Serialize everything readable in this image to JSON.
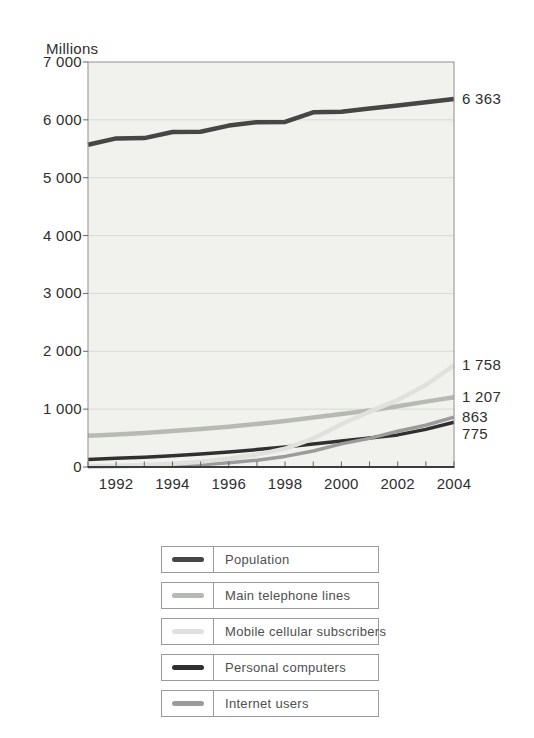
{
  "figure": {
    "unit_label": "Millions"
  },
  "chart_data": {
    "type": "line",
    "title": "",
    "xlabel": "",
    "ylabel": "Millions",
    "xlim": [
      1991,
      2004
    ],
    "ylim": [
      0,
      7000
    ],
    "grid": "horizontal",
    "legend_position": "bottom",
    "x": [
      1991,
      1992,
      1993,
      1994,
      1995,
      1996,
      1997,
      1998,
      1999,
      2000,
      2001,
      2002,
      2003,
      2004
    ],
    "y_ticks": [
      {
        "label": "7 000",
        "value": 7000
      },
      {
        "label": "6 000",
        "value": 6000
      },
      {
        "label": "5 000",
        "value": 5000
      },
      {
        "label": "4 000",
        "value": 4000
      },
      {
        "label": "3 000",
        "value": 3000
      },
      {
        "label": "2 000",
        "value": 2000
      },
      {
        "label": "1 000",
        "value": 1000
      },
      {
        "label": "0",
        "value": 0
      }
    ],
    "x_ticks": [
      {
        "label": "1992",
        "value": 1992
      },
      {
        "label": "1994",
        "value": 1994
      },
      {
        "label": "1996",
        "value": 1996
      },
      {
        "label": "1998",
        "value": 1998
      },
      {
        "label": "2000",
        "value": 2000
      },
      {
        "label": "2002",
        "value": 2002
      },
      {
        "label": "2004",
        "value": 2004
      }
    ],
    "series": [
      {
        "name": "Population",
        "color": "#464646",
        "line_width": 4.5,
        "end_label": "6 363",
        "values": [
          5570,
          5680,
          5685,
          5790,
          5795,
          5900,
          5960,
          5965,
          6130,
          6140,
          6195,
          6250,
          6305,
          6363
        ]
      },
      {
        "name": "Main telephone lines",
        "color": "#b7bab2",
        "line_width": 4.5,
        "end_label": "1 207",
        "values": [
          540,
          560,
          590,
          620,
          655,
          695,
          745,
          795,
          855,
          915,
          975,
          1050,
          1130,
          1207
        ]
      },
      {
        "name": "Mobile cellular subscribers",
        "color": "#e0e1dc",
        "line_width": 4.5,
        "end_label": "1 758",
        "values": [
          16,
          23,
          34,
          56,
          91,
          145,
          215,
          318,
          490,
          740,
          955,
          1157,
          1417,
          1758
        ]
      },
      {
        "name": "Personal computers",
        "color": "#303030",
        "line_width": 3.5,
        "end_label": "775",
        "values": [
          130,
          150,
          170,
          195,
          225,
          260,
          300,
          345,
          395,
          450,
          500,
          555,
          650,
          775
        ]
      },
      {
        "name": "Internet users",
        "color": "#9b9b9b",
        "line_width": 3.5,
        "end_label": "863",
        "values": [
          4,
          7,
          12,
          21,
          40,
          74,
          117,
          183,
          277,
          399,
          495,
          618,
          720,
          863
        ]
      }
    ]
  },
  "legend": {
    "items": [
      {
        "label": "Population",
        "color": "#464646"
      },
      {
        "label": "Main telephone lines",
        "color": "#b7bab2"
      },
      {
        "label": "Mobile cellular subscribers",
        "color": "#e0e1dc"
      },
      {
        "label": "Personal computers",
        "color": "#303030"
      },
      {
        "label": "Internet users",
        "color": "#9b9b9b"
      }
    ]
  },
  "style": {
    "plot_background": "#f1f1ee",
    "gridline_color": "#d9d9d6",
    "border_color": "#8f8f8f",
    "axis_color": "#3c3c3c",
    "tick_color": "#666666",
    "text_color": "#2e2e2e"
  }
}
